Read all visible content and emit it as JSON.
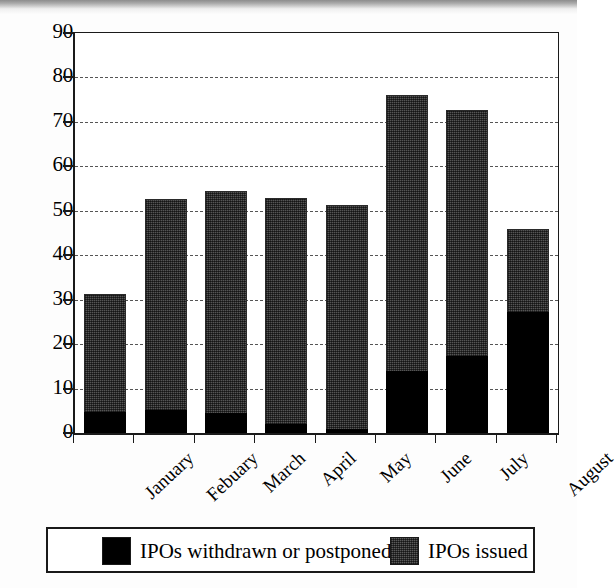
{
  "chart_data": {
    "type": "bar",
    "stacked": true,
    "title": "",
    "subtitle": "",
    "xlabel": "",
    "ylabel": "",
    "ylim": [
      0,
      90
    ],
    "ytick_step": 10,
    "yticks": [
      0,
      10,
      20,
      30,
      40,
      50,
      60,
      70,
      80,
      90
    ],
    "ytick_labels": [
      "0",
      "10",
      "20",
      "30",
      "40",
      "50",
      "60",
      "70",
      "80",
      "90"
    ],
    "grid": "horizontal-dashed",
    "legend_position": "bottom",
    "categories": [
      "January",
      "Febuary",
      "March",
      "April",
      "May",
      "June",
      "July",
      "August"
    ],
    "series": [
      {
        "name": "IPOs withdrawn or postponed",
        "color": "#000000",
        "values": [
          4.7,
          5.2,
          4.6,
          2.0,
          1.0,
          14.0,
          17.3,
          27.2
        ]
      },
      {
        "name": "IPOs issued",
        "color": "#555555",
        "values": [
          26.6,
          47.5,
          49.9,
          50.8,
          50.3,
          62.0,
          55.4,
          18.8
        ]
      }
    ],
    "totals": [
      31.3,
      52.7,
      54.5,
      52.8,
      51.3,
      76.0,
      72.7,
      46.0
    ],
    "colors": {
      "withdrawn": "#000000",
      "issued": "#555555",
      "axis": "#1a1a1a",
      "gridline": "#555555",
      "background": "#ffffff"
    }
  },
  "legend": {
    "entries": [
      {
        "label": "IPOs withdrawn or postponed",
        "swatch": "black"
      },
      {
        "label": "IPOs issued",
        "swatch": "gray"
      }
    ]
  },
  "axis": {
    "y_labels": [
      "90",
      "80",
      "70",
      "60",
      "50",
      "40",
      "30",
      "20",
      "10",
      "0"
    ]
  },
  "x_labels": [
    "January",
    "Febuary",
    "March",
    "April",
    "May",
    "June",
    "July",
    "August"
  ]
}
